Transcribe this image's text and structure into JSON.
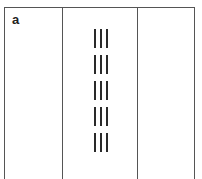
{
  "figure": {
    "panel_label": "a",
    "columns": 3,
    "line_groups": [
      {
        "top": 29,
        "bars": 3
      },
      {
        "top": 55,
        "bars": 3
      },
      {
        "top": 81,
        "bars": 3
      },
      {
        "top": 107,
        "bars": 3
      },
      {
        "top": 133,
        "bars": 3
      }
    ],
    "colors": {
      "frame": "#555555",
      "bars": "#2a2a2a",
      "background": "#ffffff"
    }
  }
}
